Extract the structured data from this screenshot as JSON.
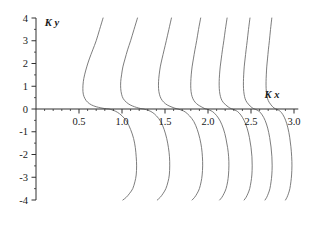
{
  "chart_data": {
    "type": "line",
    "title": "",
    "subtitle": "",
    "xlabel": "K x",
    "ylabel": "K y",
    "xlim": [
      0.0,
      3.05
    ],
    "ylim": [
      -4,
      4
    ],
    "grid": false,
    "legend": "none",
    "x_ticks_major": [
      0.5,
      1.0,
      1.5,
      2.0,
      2.5,
      3.0
    ],
    "x_tick_labels": [
      "0.5",
      "1.0",
      "1.5",
      "2.0",
      "2.5",
      "3.0"
    ],
    "x_minor_step": 0.1,
    "y_ticks_major": [
      -4,
      -3,
      -2,
      -1,
      0,
      1,
      2,
      3,
      4
    ],
    "y_tick_labels": [
      "-4",
      "-3",
      "-2",
      "-1",
      "0",
      "1",
      "2",
      "3",
      "4"
    ],
    "y_minor_step": 0.5,
    "axis_origin": {
      "x": 0.0,
      "y": 0.0
    },
    "series": [
      {
        "name": "branch-1",
        "zero_crossing": 0.85,
        "x": [
          0.78,
          0.74,
          0.7,
          0.66,
          0.62,
          0.59,
          0.565,
          0.55,
          0.545,
          0.55,
          0.57,
          0.6,
          0.645,
          0.7,
          0.755,
          0.8,
          0.835,
          0.85,
          0.868,
          0.9,
          0.945,
          1.0,
          1.055,
          1.1,
          1.135,
          1.155,
          1.165,
          1.17,
          1.165,
          1.15,
          1.125,
          1.09,
          1.05,
          1.01
        ],
        "y": [
          4.0,
          3.5,
          3.0,
          2.6,
          2.2,
          1.85,
          1.5,
          1.2,
          0.9,
          0.65,
          0.45,
          0.3,
          0.18,
          0.1,
          0.05,
          0.02,
          0.005,
          0.0,
          -0.02,
          -0.06,
          -0.14,
          -0.3,
          -0.55,
          -0.9,
          -1.3,
          -1.7,
          -2.1,
          -2.5,
          -2.9,
          -3.2,
          -3.5,
          -3.7,
          -3.88,
          -4.0
        ]
      },
      {
        "name": "branch-2",
        "zero_crossing": 1.25,
        "x": [
          1.18,
          1.14,
          1.1,
          1.065,
          1.035,
          1.01,
          0.995,
          0.985,
          0.985,
          0.995,
          1.015,
          1.05,
          1.095,
          1.145,
          1.195,
          1.23,
          1.248,
          1.25,
          1.27,
          1.305,
          1.35,
          1.4,
          1.45,
          1.49,
          1.52,
          1.54,
          1.552,
          1.555,
          1.55,
          1.535,
          1.51,
          1.48,
          1.445,
          1.41
        ],
        "y": [
          4.0,
          3.5,
          3.0,
          2.6,
          2.2,
          1.85,
          1.5,
          1.2,
          0.9,
          0.65,
          0.45,
          0.3,
          0.18,
          0.1,
          0.04,
          0.012,
          0.003,
          0.0,
          -0.02,
          -0.06,
          -0.14,
          -0.3,
          -0.55,
          -0.9,
          -1.3,
          -1.7,
          -2.1,
          -2.5,
          -2.9,
          -3.2,
          -3.5,
          -3.7,
          -3.88,
          -4.0
        ]
      },
      {
        "name": "branch-3",
        "zero_crossing": 1.65,
        "x": [
          1.575,
          1.545,
          1.515,
          1.49,
          1.465,
          1.445,
          1.432,
          1.425,
          1.425,
          1.435,
          1.455,
          1.485,
          1.525,
          1.57,
          1.615,
          1.64,
          1.648,
          1.65,
          1.665,
          1.695,
          1.735,
          1.785,
          1.835,
          1.875,
          1.905,
          1.925,
          1.935,
          1.938,
          1.932,
          1.92,
          1.9,
          1.875,
          1.845,
          1.815
        ],
        "y": [
          4.0,
          3.5,
          3.0,
          2.6,
          2.2,
          1.85,
          1.5,
          1.2,
          0.9,
          0.65,
          0.45,
          0.3,
          0.18,
          0.1,
          0.035,
          0.01,
          0.002,
          0.0,
          -0.018,
          -0.055,
          -0.13,
          -0.3,
          -0.55,
          -0.9,
          -1.3,
          -1.7,
          -2.1,
          -2.5,
          -2.9,
          -3.2,
          -3.5,
          -3.7,
          -3.88,
          -4.0
        ]
      },
      {
        "name": "branch-4",
        "zero_crossing": 1.98,
        "x": [
          1.915,
          1.89,
          1.868,
          1.848,
          1.83,
          1.815,
          1.805,
          1.8,
          1.8,
          1.808,
          1.825,
          1.85,
          1.885,
          1.922,
          1.955,
          1.972,
          1.978,
          1.98,
          1.993,
          2.018,
          2.055,
          2.098,
          2.142,
          2.18,
          2.208,
          2.228,
          2.24,
          2.243,
          2.238,
          2.228,
          2.21,
          2.188,
          2.162,
          2.135
        ],
        "y": [
          4.0,
          3.5,
          3.0,
          2.6,
          2.2,
          1.85,
          1.5,
          1.2,
          0.9,
          0.65,
          0.45,
          0.3,
          0.18,
          0.1,
          0.03,
          0.008,
          0.002,
          0.0,
          -0.016,
          -0.05,
          -0.12,
          -0.28,
          -0.53,
          -0.88,
          -1.28,
          -1.7,
          -2.1,
          -2.5,
          -2.9,
          -3.2,
          -3.5,
          -3.7,
          -3.88,
          -4.0
        ]
      },
      {
        "name": "branch-5",
        "zero_crossing": 2.28,
        "x": [
          2.222,
          2.202,
          2.184,
          2.168,
          2.154,
          2.142,
          2.134,
          2.13,
          2.131,
          2.139,
          2.153,
          2.175,
          2.205,
          2.236,
          2.263,
          2.274,
          2.279,
          2.28,
          2.291,
          2.313,
          2.345,
          2.383,
          2.422,
          2.456,
          2.482,
          2.5,
          2.511,
          2.514,
          2.51,
          2.5,
          2.485,
          2.466,
          2.443,
          2.42
        ],
        "y": [
          4.0,
          3.5,
          3.0,
          2.6,
          2.2,
          1.85,
          1.5,
          1.2,
          0.9,
          0.65,
          0.45,
          0.3,
          0.18,
          0.09,
          0.028,
          0.007,
          0.002,
          0.0,
          -0.014,
          -0.048,
          -0.115,
          -0.27,
          -0.52,
          -0.86,
          -1.26,
          -1.68,
          -2.1,
          -2.5,
          -2.9,
          -3.2,
          -3.5,
          -3.7,
          -3.88,
          -4.0
        ]
      },
      {
        "name": "branch-6",
        "zero_crossing": 2.54,
        "x": [
          2.488,
          2.471,
          2.456,
          2.443,
          2.431,
          2.421,
          2.415,
          2.412,
          2.413,
          2.42,
          2.432,
          2.451,
          2.477,
          2.503,
          2.526,
          2.535,
          2.539,
          2.54,
          2.55,
          2.569,
          2.597,
          2.63,
          2.664,
          2.694,
          2.717,
          2.733,
          2.743,
          2.746,
          2.742,
          2.733,
          2.72,
          2.703,
          2.683,
          2.663
        ],
        "y": [
          4.0,
          3.5,
          3.0,
          2.6,
          2.2,
          1.85,
          1.5,
          1.2,
          0.9,
          0.65,
          0.45,
          0.3,
          0.18,
          0.085,
          0.026,
          0.006,
          0.0015,
          0.0,
          -0.013,
          -0.045,
          -0.11,
          -0.26,
          -0.5,
          -0.84,
          -1.25,
          -1.67,
          -2.1,
          -2.5,
          -2.9,
          -3.2,
          -3.5,
          -3.7,
          -3.88,
          -4.0
        ]
      },
      {
        "name": "branch-7",
        "zero_crossing": 2.79,
        "x": [
          2.742,
          2.727,
          2.714,
          2.702,
          2.692,
          2.683,
          2.678,
          2.675,
          2.676,
          2.682,
          2.693,
          2.71,
          2.733,
          2.757,
          2.777,
          2.786,
          2.789,
          2.79,
          2.799,
          2.816,
          2.841,
          2.871,
          2.902,
          2.929,
          2.95,
          2.964,
          2.973,
          2.976,
          2.972,
          2.964,
          2.952,
          2.937,
          2.919,
          2.901
        ],
        "y": [
          4.0,
          3.5,
          3.0,
          2.6,
          2.2,
          1.85,
          1.5,
          1.2,
          0.9,
          0.65,
          0.45,
          0.3,
          0.18,
          0.08,
          0.024,
          0.006,
          0.0015,
          0.0,
          -0.012,
          -0.042,
          -0.105,
          -0.25,
          -0.49,
          -0.83,
          -1.24,
          -1.66,
          -2.1,
          -2.5,
          -2.9,
          -3.2,
          -3.5,
          -3.7,
          -3.88,
          -4.0
        ]
      }
    ],
    "colors": {
      "curve": "#6e6e6e",
      "axis": "#303030",
      "text": "#1a1a1a",
      "background": "#ffffff"
    }
  }
}
